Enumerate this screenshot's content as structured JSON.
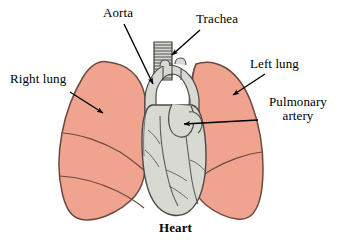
{
  "figure": {
    "type": "anatomical-illustration",
    "canvas": {
      "width": 340,
      "height": 247,
      "background": "#ffffff"
    },
    "colors": {
      "lung_fill": "#F0A38E",
      "lung_stroke": "#6B4A42",
      "heart_fill": "#D9D9D4",
      "heart_stroke": "#4A4A48",
      "vessel_stroke": "#5A5A58",
      "trachea_fill": "#D9D9D4",
      "label_text": "#000000",
      "leader_line": "#000000"
    },
    "labels": [
      {
        "id": "right-lung",
        "text": "Right lung",
        "bold": false,
        "leader": {
          "from": [
            70,
            92
          ],
          "to": [
            103,
            113
          ],
          "arrowhead": true
        }
      },
      {
        "id": "left-lung",
        "text": "Left lung",
        "bold": false,
        "leader": {
          "from": [
            265,
            74
          ],
          "to": [
            233,
            95
          ],
          "arrowhead": true
        }
      },
      {
        "id": "aorta",
        "text": "Aorta",
        "bold": false,
        "leader": {
          "from": [
            124,
            24
          ],
          "to": [
            153,
            84
          ],
          "arrowhead": true
        }
      },
      {
        "id": "trachea",
        "text": "Trachea",
        "bold": false,
        "leader": {
          "from": [
            200,
            30
          ],
          "to": [
            172,
            55
          ],
          "arrowhead": true
        }
      },
      {
        "id": "pulmonary-artery",
        "text_line1": "Pulmonary",
        "text_line2": "artery",
        "bold": false,
        "leader": {
          "from": [
            258,
            120
          ],
          "to": [
            184,
            124
          ],
          "arrowhead": true
        }
      },
      {
        "id": "heart",
        "text": "Heart",
        "bold": true,
        "leader": null
      }
    ],
    "parts": [
      {
        "name": "right-lung",
        "side": "viewer-left",
        "fill": "#F0A38E",
        "lobes": 3
      },
      {
        "name": "left-lung",
        "side": "viewer-right",
        "fill": "#F0A38E",
        "lobes": 2
      },
      {
        "name": "heart",
        "fill": "#D9D9D4"
      },
      {
        "name": "trachea",
        "fill": "#D9D9D4",
        "cartilage_rings": 14
      },
      {
        "name": "aorta",
        "fill": "#D9D9D4"
      },
      {
        "name": "pulmonary-artery",
        "fill": "#D9D9D4"
      }
    ]
  }
}
